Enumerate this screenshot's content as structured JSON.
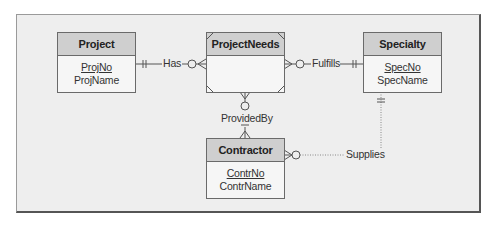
{
  "diagram": {
    "type": "ERD",
    "entities": [
      {
        "name": "Project",
        "attributes": [
          {
            "name": "ProjNo",
            "primary_key": true
          },
          {
            "name": "ProjName",
            "primary_key": false
          }
        ]
      },
      {
        "name": "ProjectNeeds",
        "associative": true,
        "attributes": []
      },
      {
        "name": "Specialty",
        "attributes": [
          {
            "name": "SpecNo",
            "primary_key": true
          },
          {
            "name": "SpecName",
            "primary_key": false
          }
        ]
      },
      {
        "name": "Contractor",
        "attributes": [
          {
            "name": "ContrNo",
            "primary_key": true
          },
          {
            "name": "ContrName",
            "primary_key": false
          }
        ]
      }
    ],
    "relationships": [
      {
        "name": "Has",
        "from": "Project",
        "to": "ProjectNeeds",
        "from_cardinality": "exactly-one",
        "to_cardinality": "zero-or-many",
        "identifying": true
      },
      {
        "name": "Fulfills",
        "from": "ProjectNeeds",
        "to": "Specialty",
        "from_cardinality": "zero-or-many",
        "to_cardinality": "exactly-one",
        "identifying": true
      },
      {
        "name": "ProvidedBy",
        "from": "ProjectNeeds",
        "to": "Contractor",
        "from_cardinality": "zero-or-many",
        "to_cardinality": "exactly-one",
        "identifying": true
      },
      {
        "name": "Supplies",
        "from": "Contractor",
        "to": "Specialty",
        "from_cardinality": "zero-or-many",
        "to_cardinality": "exactly-one",
        "identifying": false
      }
    ]
  },
  "colors": {
    "frame_bg": "#eeeeee",
    "header_bg": "#cfcfcf",
    "line": "#6a6a6a"
  }
}
